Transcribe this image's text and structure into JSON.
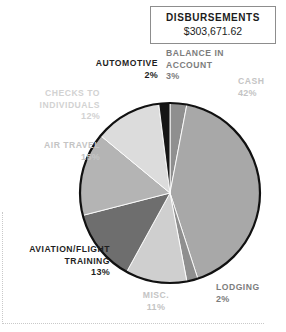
{
  "title_card": {
    "heading": "DISBURSEMENTS",
    "amount": "$303,671.62"
  },
  "colors": {
    "automotive": "#151515",
    "balance_in_account": "#8f8f8f",
    "cash": "#a8a8a8",
    "lodging": "#8f8f8f",
    "misc": "#cfcfcf",
    "aviation_flight_training": "#6e6e6e",
    "air_travel": "#b4b4b4",
    "checks_to_individuals": "#dcdcdc",
    "outline": "#111111",
    "label_dark": "#1f1f1f",
    "label_mid": "#7d7d7d",
    "label_light": "#c4c4c4",
    "background": "#ffffff",
    "frame_dotted": "#c9c9c9"
  },
  "labels": {
    "automotive": {
      "name": "AUTOMOTIVE",
      "percent": "2%"
    },
    "balance": {
      "name": "BALANCE IN ACCOUNT",
      "percent": "3%"
    },
    "cash": {
      "name": "CASH",
      "percent": "42%"
    },
    "checks": {
      "name": "CHECKS TO INDIVIDUALS",
      "percent": "12%"
    },
    "airtravel": {
      "name": "AIR TRAVEL",
      "percent": "15%"
    },
    "aviation": {
      "name": "AVIATION/FLIGHT TRAINING",
      "percent": "13%"
    },
    "misc": {
      "name": "MISC.",
      "percent": "11%"
    },
    "lodging": {
      "name": "LODGING",
      "percent": "2%"
    }
  },
  "chart_data": {
    "type": "pie",
    "title": "DISBURSEMENTS",
    "subtitle": "$303,671.62",
    "total_label": "$303,671.62",
    "total_value": 303671.62,
    "units": "percent of disbursements",
    "legend": "labels placed around pie (no separate legend box)",
    "start_angle_deg": 0,
    "direction": "clockwise",
    "categories": [
      "Balance in Account",
      "Cash",
      "Lodging",
      "Misc.",
      "Aviation/Flight Training",
      "Air Travel",
      "Checks to Individuals",
      "Automotive"
    ],
    "values": [
      3,
      42,
      2,
      11,
      13,
      15,
      12,
      2
    ],
    "slice_colors": [
      "#8f8f8f",
      "#a8a8a8",
      "#8f8f8f",
      "#cfcfcf",
      "#6e6e6e",
      "#b4b4b4",
      "#dcdcdc",
      "#151515"
    ],
    "data_labels": [
      "3%",
      "42%",
      "2%",
      "11%",
      "13%",
      "15%",
      "12%",
      "2%"
    ],
    "grid": false,
    "xlabel": "",
    "ylabel": ""
  }
}
